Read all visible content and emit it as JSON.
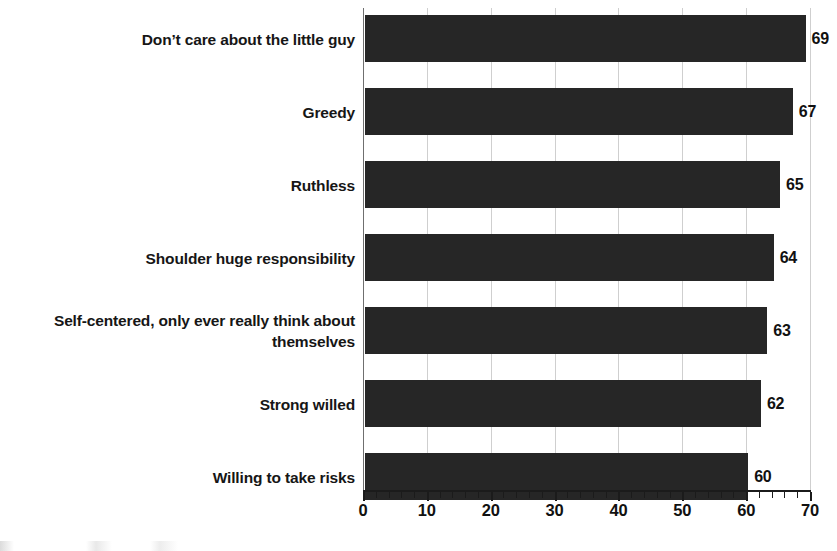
{
  "chart_data": {
    "type": "bar",
    "orientation": "horizontal",
    "title": "",
    "subtitle": "",
    "xlabel": "",
    "ylabel": "",
    "xlim": [
      0,
      70
    ],
    "xticks": [
      0,
      10,
      20,
      30,
      40,
      50,
      60,
      70
    ],
    "xtick_labels": [
      "0",
      "10",
      "20",
      "30",
      "40",
      "50",
      "60",
      "70"
    ],
    "minor_tick_step": 2,
    "grid": true,
    "grid_axis": "x",
    "legend": false,
    "bar_color": "#262626",
    "grid_color": "#cfcfcf",
    "axis_color": "#1b1b1b",
    "categories": [
      "Don’t care about the little guy",
      "Greedy",
      "Ruthless",
      "Shoulder huge responsibility",
      "Self-centered, only ever really think about\nthemselves",
      "Strong willed",
      "Willing to take risks"
    ],
    "values": [
      69,
      67,
      65,
      64,
      63,
      62,
      60
    ],
    "value_labels": [
      "69",
      "67",
      "65",
      "64",
      "63",
      "62",
      "60"
    ]
  }
}
